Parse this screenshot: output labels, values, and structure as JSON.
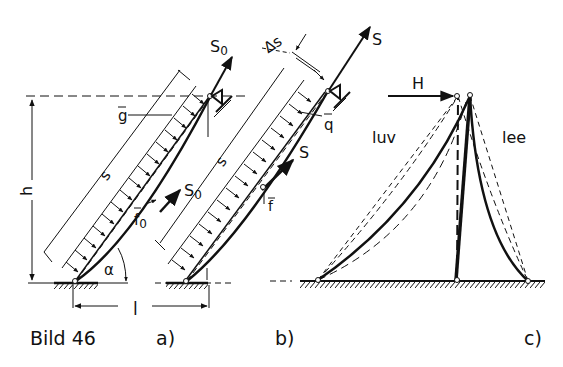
{
  "figure": {
    "caption": "Bild 46",
    "panels": [
      {
        "id": "a",
        "label": "a)"
      },
      {
        "id": "b",
        "label": "b)"
      },
      {
        "id": "c",
        "label": "c)"
      }
    ]
  },
  "panel_a": {
    "top_force": "S",
    "top_force_sub": "0",
    "mid_force": "S",
    "mid_force_sub": "0",
    "load_label": "g",
    "sag_label": "f",
    "sag_sub": "0",
    "length_label": "s",
    "height_label": "h",
    "span_label": "l",
    "angle_label": "α"
  },
  "panel_b": {
    "top_force": "S",
    "mid_force": "S",
    "load_label": "q",
    "sag_label": "f",
    "length_label": "s",
    "delta_label": "Δs"
  },
  "panel_c": {
    "force_label": "H",
    "windward_label": "luv",
    "leeward_label": "lee"
  },
  "colors": {
    "ink": "#111111",
    "background": "#ffffff"
  }
}
